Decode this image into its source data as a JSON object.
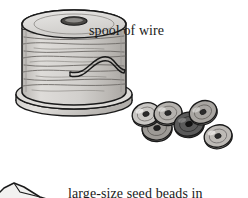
{
  "image": {
    "kind": "craft-supplies-line-illustration",
    "width": 248,
    "height": 198,
    "background_color": "#ffffff",
    "ink_color": "#1a1a1a"
  },
  "captions": {
    "spool_label": "spool of wire",
    "beads_label_line1": "large-size seed beads in",
    "beads_label_line2": "your choice of colors"
  },
  "objects": {
    "spool": {
      "name": "spool of wire",
      "fill_color": "#d4d2cf",
      "shade_color": "#b9b6b2",
      "outline_color": "#1a1a1a",
      "top_ellipse": {
        "cx": 74,
        "cy": 29,
        "rx": 52,
        "ry": 14
      },
      "top_slot": {
        "cx": 74,
        "cy": 25,
        "rx": 12,
        "ry": 4
      },
      "body": {
        "x": 22,
        "y": 29,
        "width": 104,
        "height": 68
      },
      "base_ellipse": {
        "cx": 74,
        "cy": 101,
        "rx": 58,
        "ry": 15
      },
      "winding_line_count": 13
    },
    "wire": {
      "name": "wire strand",
      "color": "#1a1a1a",
      "path": "M 72 75 C 88 79, 92 63, 104 61 C 116 59, 116 73, 125 74",
      "end_x": 125,
      "end_y": 74
    },
    "beads": [
      {
        "id": "bead-1",
        "cx": 146,
        "cy": 114,
        "rx": 14,
        "ry": 11,
        "rot": -16,
        "fill": "#c9c7c4",
        "hole": "#2b2b2b"
      },
      {
        "id": "bead-2",
        "cx": 168,
        "cy": 113,
        "rx": 14,
        "ry": 11,
        "rot": -10,
        "fill": "#b5b2ae",
        "hole": "#2b2b2b"
      },
      {
        "id": "bead-3",
        "cx": 157,
        "cy": 128,
        "rx": 15,
        "ry": 12,
        "rot": -8,
        "fill": "#9d9a96",
        "hole": "#1f1f1f"
      },
      {
        "id": "bead-4",
        "cx": 203,
        "cy": 112,
        "rx": 14,
        "ry": 11,
        "rot": -22,
        "fill": "#a8a5a1",
        "hole": "#2b2b2b"
      },
      {
        "id": "bead-5",
        "cx": 189,
        "cy": 124,
        "rx": 15,
        "ry": 12,
        "rot": -12,
        "fill": "#5a5a5a",
        "hole": "#141414"
      },
      {
        "id": "bead-6",
        "cx": 218,
        "cy": 136,
        "rx": 14,
        "ry": 11,
        "rot": -14,
        "fill": "#bdbab6",
        "hole": "#2b2b2b"
      }
    ],
    "corner_shape": {
      "name": "partial object bottom-left",
      "fill": "#efefee",
      "outline": "#1a1a1a",
      "path": "M -6 198 L 6 186 L 18 182 L 26 186 L 40 196 L 46 198 Z"
    }
  }
}
